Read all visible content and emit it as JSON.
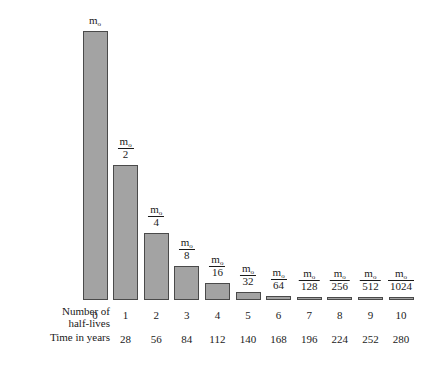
{
  "chart_data": {
    "type": "bar",
    "title": "",
    "xlabel": "Number of half-lives",
    "ylabel": "",
    "categories": [
      "0",
      "1",
      "2",
      "3",
      "4",
      "5",
      "6",
      "7",
      "8",
      "9",
      "10"
    ],
    "values": [
      1,
      0.5,
      0.25,
      0.125,
      0.0625,
      0.03125,
      0.015625,
      0.0078125,
      0.00390625,
      0.001953125,
      0.0009765625
    ],
    "value_labels": [
      "m0",
      "m0/2",
      "m0/4",
      "m0/8",
      "m0/16",
      "m0/32",
      "m0/64",
      "m0/128",
      "m0/256",
      "m0/512",
      "m0/1024"
    ],
    "bar_numerators": [
      "m",
      "m",
      "m",
      "m",
      "m",
      "m",
      "m",
      "m",
      "m",
      "m",
      "m"
    ],
    "bar_subscripts": [
      "o",
      "o",
      "o",
      "o",
      "o",
      "o",
      "o",
      "o",
      "o",
      "o",
      "o"
    ],
    "bar_denominators": [
      "",
      "2",
      "4",
      "8",
      "16",
      "32",
      "64",
      "128",
      "256",
      "512",
      "1024"
    ],
    "secondary_axis_label": "Time in years",
    "secondary_axis_values": [
      "",
      "28",
      "56",
      "84",
      "112",
      "140",
      "168",
      "196",
      "224",
      "252",
      "280"
    ],
    "ylim": [
      0,
      1
    ],
    "grid": false,
    "legend": null,
    "bar_fill_color": "#a3a3a3",
    "bar_border_color": "#4a4a4a",
    "background_color": "#ffffff"
  },
  "axis_rows": {
    "halflives_line1": "Number of",
    "halflives_line2": "half-lives",
    "time_label": "Time in years"
  }
}
